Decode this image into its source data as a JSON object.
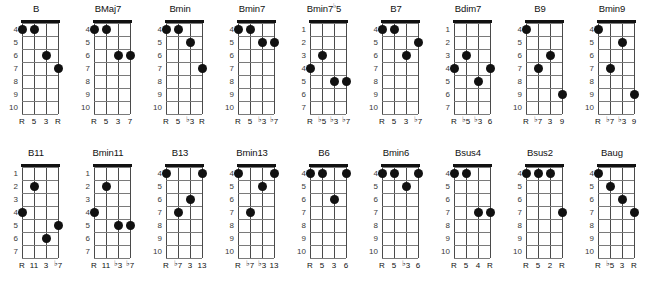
{
  "chart_data": {
    "type": "table",
    "xlabel": "",
    "ylabel": "",
    "layout": {
      "rows": 2,
      "columns": 9,
      "strings": 4,
      "frets_shown": 7,
      "string_order": "low-to-high left-to-right",
      "grid": true,
      "legend": "none"
    },
    "colors": {
      "dot": "#111111",
      "nut": "#111111",
      "fret_line": "#7a7a7a",
      "string_line": "#4a4a4a",
      "background": "#ffffff",
      "fret_number": "#3a3a3a"
    },
    "diagrams": [
      {
        "name": "B",
        "start_fret": 4,
        "fret_numbers": [
          "4",
          "5",
          "6",
          "7",
          "8",
          "9",
          "10"
        ],
        "intervals": [
          "R",
          "5",
          "3",
          "R"
        ],
        "dots": [
          {
            "string": 1,
            "fret": 4
          },
          {
            "string": 2,
            "fret": 4
          },
          {
            "string": 3,
            "fret": 6
          },
          {
            "string": 4,
            "fret": 7
          }
        ]
      },
      {
        "name": "BMaj7",
        "start_fret": 4,
        "fret_numbers": [
          "4",
          "5",
          "6",
          "7",
          "8",
          "9",
          "10"
        ],
        "intervals": [
          "R",
          "5",
          "3",
          "7"
        ],
        "dots": [
          {
            "string": 1,
            "fret": 4
          },
          {
            "string": 2,
            "fret": 4
          },
          {
            "string": 3,
            "fret": 6
          },
          {
            "string": 4,
            "fret": 6
          }
        ]
      },
      {
        "name": "Bmin",
        "start_fret": 4,
        "fret_numbers": [
          "4",
          "5",
          "6",
          "7",
          "8",
          "9",
          "10"
        ],
        "intervals": [
          "R",
          "5",
          "♭3",
          "R"
        ],
        "dots": [
          {
            "string": 1,
            "fret": 4
          },
          {
            "string": 2,
            "fret": 4
          },
          {
            "string": 3,
            "fret": 5
          },
          {
            "string": 4,
            "fret": 7
          }
        ]
      },
      {
        "name": "Bmin7",
        "start_fret": 4,
        "fret_numbers": [
          "4",
          "5",
          "6",
          "7",
          "8",
          "9",
          "10"
        ],
        "intervals": [
          "R",
          "5",
          "♭3",
          "♭7"
        ],
        "dots": [
          {
            "string": 1,
            "fret": 4
          },
          {
            "string": 2,
            "fret": 4
          },
          {
            "string": 3,
            "fret": 5
          },
          {
            "string": 4,
            "fret": 5
          }
        ]
      },
      {
        "name": "Bmin7♭5",
        "start_fret": 1,
        "fret_numbers": [
          "1",
          "2",
          "3",
          "4",
          "5",
          "6",
          "7"
        ],
        "intervals": [
          "R",
          "♭5",
          "♭3",
          "♭7"
        ],
        "dots": [
          {
            "string": 1,
            "fret": 4
          },
          {
            "string": 2,
            "fret": 3
          },
          {
            "string": 3,
            "fret": 5
          },
          {
            "string": 4,
            "fret": 5
          }
        ]
      },
      {
        "name": "B7",
        "start_fret": 4,
        "fret_numbers": [
          "4",
          "5",
          "6",
          "7",
          "8",
          "9",
          "10"
        ],
        "intervals": [
          "R",
          "5",
          "3",
          "♭7"
        ],
        "dots": [
          {
            "string": 1,
            "fret": 4
          },
          {
            "string": 2,
            "fret": 4
          },
          {
            "string": 3,
            "fret": 6
          },
          {
            "string": 4,
            "fret": 5
          }
        ]
      },
      {
        "name": "Bdim7",
        "start_fret": 1,
        "fret_numbers": [
          "1",
          "2",
          "3",
          "4",
          "5",
          "6",
          "7"
        ],
        "intervals": [
          "R",
          "♭5",
          "♭3",
          "6"
        ],
        "dots": [
          {
            "string": 1,
            "fret": 4
          },
          {
            "string": 2,
            "fret": 3
          },
          {
            "string": 3,
            "fret": 5
          },
          {
            "string": 4,
            "fret": 4
          }
        ]
      },
      {
        "name": "B9",
        "start_fret": 4,
        "fret_numbers": [
          "4",
          "5",
          "6",
          "7",
          "8",
          "9",
          "10"
        ],
        "intervals": [
          "R",
          "♭7",
          "3",
          "9"
        ],
        "dots": [
          {
            "string": 1,
            "fret": 4
          },
          {
            "string": 2,
            "fret": 7
          },
          {
            "string": 3,
            "fret": 6
          },
          {
            "string": 4,
            "fret": 9
          }
        ]
      },
      {
        "name": "Bmin9",
        "start_fret": 4,
        "fret_numbers": [
          "4",
          "5",
          "6",
          "7",
          "8",
          "9",
          "10"
        ],
        "intervals": [
          "R",
          "♭7",
          "♭3",
          "9"
        ],
        "dots": [
          {
            "string": 1,
            "fret": 4
          },
          {
            "string": 2,
            "fret": 7
          },
          {
            "string": 3,
            "fret": 5
          },
          {
            "string": 4,
            "fret": 9
          }
        ]
      },
      {
        "name": "B11",
        "start_fret": 1,
        "fret_numbers": [
          "1",
          "2",
          "3",
          "4",
          "5",
          "6",
          "7"
        ],
        "intervals": [
          "R",
          "11",
          "3",
          "♭7"
        ],
        "dots": [
          {
            "string": 1,
            "fret": 4
          },
          {
            "string": 2,
            "fret": 2
          },
          {
            "string": 3,
            "fret": 6
          },
          {
            "string": 4,
            "fret": 5
          }
        ]
      },
      {
        "name": "Bmin11",
        "start_fret": 1,
        "fret_numbers": [
          "1",
          "2",
          "3",
          "4",
          "5",
          "6",
          "7"
        ],
        "intervals": [
          "R",
          "11",
          "♭3",
          "♭7"
        ],
        "dots": [
          {
            "string": 1,
            "fret": 4
          },
          {
            "string": 2,
            "fret": 2
          },
          {
            "string": 3,
            "fret": 5
          },
          {
            "string": 4,
            "fret": 5
          }
        ]
      },
      {
        "name": "B13",
        "start_fret": 4,
        "fret_numbers": [
          "4",
          "5",
          "6",
          "7",
          "8",
          "9",
          "10"
        ],
        "intervals": [
          "R",
          "♭7",
          "3",
          "13"
        ],
        "dots": [
          {
            "string": 1,
            "fret": 4
          },
          {
            "string": 2,
            "fret": 7
          },
          {
            "string": 3,
            "fret": 6
          },
          {
            "string": 4,
            "fret": 4
          }
        ]
      },
      {
        "name": "Bmin13",
        "start_fret": 4,
        "fret_numbers": [
          "4",
          "5",
          "6",
          "7",
          "8",
          "9",
          "10"
        ],
        "intervals": [
          "R",
          "♭7",
          "♭3",
          "13"
        ],
        "dots": [
          {
            "string": 1,
            "fret": 4
          },
          {
            "string": 2,
            "fret": 7
          },
          {
            "string": 3,
            "fret": 5
          },
          {
            "string": 4,
            "fret": 4
          }
        ]
      },
      {
        "name": "B6",
        "start_fret": 4,
        "fret_numbers": [
          "4",
          "5",
          "6",
          "7",
          "8",
          "9",
          "10"
        ],
        "intervals": [
          "R",
          "5",
          "3",
          "6"
        ],
        "dots": [
          {
            "string": 1,
            "fret": 4
          },
          {
            "string": 2,
            "fret": 4
          },
          {
            "string": 3,
            "fret": 6
          },
          {
            "string": 4,
            "fret": 4
          }
        ]
      },
      {
        "name": "Bmin6",
        "start_fret": 4,
        "fret_numbers": [
          "4",
          "5",
          "6",
          "7",
          "8",
          "9",
          "10"
        ],
        "intervals": [
          "R",
          "5",
          "♭3",
          "6"
        ],
        "dots": [
          {
            "string": 1,
            "fret": 4
          },
          {
            "string": 2,
            "fret": 4
          },
          {
            "string": 3,
            "fret": 5
          },
          {
            "string": 4,
            "fret": 4
          }
        ]
      },
      {
        "name": "Bsus4",
        "start_fret": 4,
        "fret_numbers": [
          "4",
          "5",
          "6",
          "7",
          "8",
          "9",
          "10"
        ],
        "intervals": [
          "R",
          "5",
          "4",
          "R"
        ],
        "dots": [
          {
            "string": 1,
            "fret": 4
          },
          {
            "string": 2,
            "fret": 4
          },
          {
            "string": 3,
            "fret": 7
          },
          {
            "string": 4,
            "fret": 7
          }
        ]
      },
      {
        "name": "Bsus2",
        "start_fret": 4,
        "fret_numbers": [
          "4",
          "5",
          "6",
          "7",
          "8",
          "9",
          "10"
        ],
        "intervals": [
          "R",
          "5",
          "2",
          "R"
        ],
        "dots": [
          {
            "string": 1,
            "fret": 4
          },
          {
            "string": 2,
            "fret": 4
          },
          {
            "string": 3,
            "fret": 4
          },
          {
            "string": 4,
            "fret": 7
          }
        ]
      },
      {
        "name": "Baug",
        "start_fret": 4,
        "fret_numbers": [
          "4",
          "5",
          "6",
          "7",
          "8",
          "9",
          "10"
        ],
        "intervals": [
          "R",
          "♭5",
          "3",
          "R"
        ],
        "dots": [
          {
            "string": 1,
            "fret": 4
          },
          {
            "string": 2,
            "fret": 5
          },
          {
            "string": 3,
            "fret": 6
          },
          {
            "string": 4,
            "fret": 7
          }
        ]
      }
    ]
  }
}
